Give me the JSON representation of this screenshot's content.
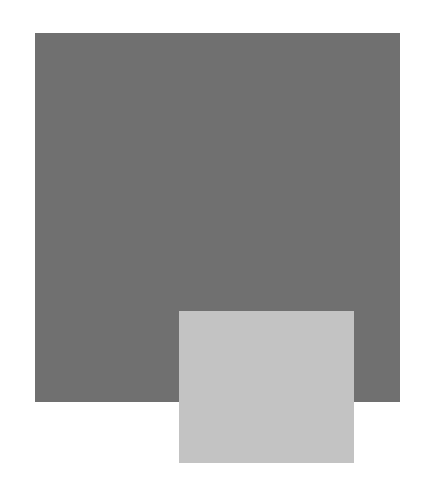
{
  "page": {
    "background": "#ffffff",
    "bleed_through_text": ""
  },
  "figures": [
    {
      "name": "dark-gray-block",
      "color": "#707070"
    },
    {
      "name": "light-gray-block",
      "color": "#c3c3c3"
    }
  ]
}
